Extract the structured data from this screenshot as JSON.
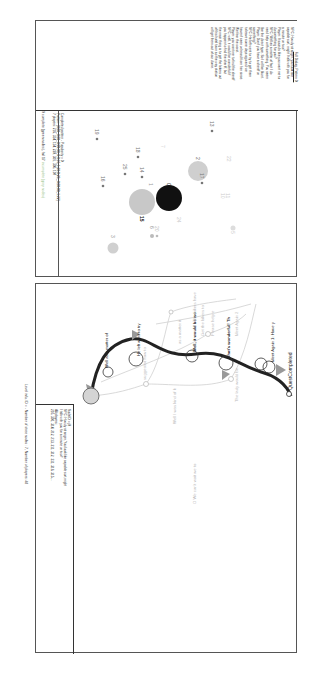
{
  "top_panel": {
    "header": "Level info - Total number of sequences (nodes): 26 with 9 complete (green nodes), fail 17",
    "header_green": "incomplete (grey nodes)",
    "info_box": {
      "line1": "Completed pattern - Popularity = 0",
      "line2": "Pattern: [0,00_0,00_0,99,99_0,9,16_1,20,0,20,_0,00,00_1,22]",
      "line3": "7 players: 216, 314, 114, 220, 301, 306, 107"
    },
    "dialog_box": {
      "title": "Full Dialog, Pattern 0:",
      "lines": [
        "NPC: Howdy stranger, you look like",
        "capable sort, might I talk with you for",
        "a minute or two?",
        "Player: It sounds like you want me to",
        "do something for you?",
        "NPC: Well as a matter of fact I do",
        "need help with something. You seem",
        "like the direct type. So I will be blunt.",
        "Player: Don't you have a sheriff or",
        "something?",
        "NPC: He left went to try to get them",
        "to leave some days ago and we",
        "haven't seen or heard from him since.",
        "We fear the worst.",
        "Player: you want me to find the sheriff",
        "NPC: well, it would be wonderful if",
        "you happen to find the sheriff, but",
        "the main thing is to get the bikers out",
        "of this hotel town so the way station",
        "will get them out of our dome.",
        "Player: Ok, I will get the bikers to",
        "leave town.",
        "NPC: That's wonderful! Thank you",
        "very much. Please come back and tell",
        "me how it went when you are done.",
        "But before you head out, maybe you",
        "should look in the sheriff's office.",
        "You might find something to help me",
        "get rid of the bikers in there. All the",
        "hope and prayers go with you.",
        "Player: Ok, see you around",
        "NPC: Meet Again 1: Have you kicked",
        "the bikers out of the town?",
        "Player: The biker will not trouble you",
        "anymore"
      ]
    },
    "clusters": [
      {
        "id": "0",
        "size": "large",
        "color": "#111111",
        "label": "0"
      },
      {
        "id": "15",
        "size": "large",
        "color": "#c8c8c8",
        "label": "15"
      },
      {
        "id": "2",
        "size": "medium",
        "color": "#cfcfcf",
        "label": "2"
      },
      {
        "id": "3",
        "size": "small",
        "color": "#d0d0d0",
        "label": "3"
      },
      {
        "id": "17",
        "label": "17"
      },
      {
        "id": "19",
        "label": "19"
      },
      {
        "id": "16",
        "label": "16"
      },
      {
        "id": "25",
        "label": "25"
      },
      {
        "id": "14",
        "label": "14"
      },
      {
        "id": "18",
        "label": "18"
      },
      {
        "id": "7",
        "label": "7"
      },
      {
        "id": "13",
        "label": "13"
      },
      {
        "id": "22",
        "label": "22"
      },
      {
        "id": "6",
        "label": "6"
      },
      {
        "id": "20",
        "label": "20"
      },
      {
        "id": "24",
        "label": "24"
      },
      {
        "id": "10",
        "label": "10"
      },
      {
        "id": "11",
        "label": "11"
      },
      {
        "id": "1",
        "label": "1"
      },
      {
        "id": "5",
        "label": "5"
      }
    ]
  },
  "bottom_panel": {
    "header": "Level info, ID = - Number of stree nodes : 7, Number of players: 48",
    "node_box": {
      "line1": "NodeID = j0",
      "line2": "NPC: Howdy stranger, You look like capable sort,might",
      "line3": "I talk with you for a minute or two?",
      "line4": "48 players:",
      "line5": "216, 301, 314, 212, 213, 211, 312, 311, 316, 315,..."
    },
    "nodes": {
      "n1": "Well as a matter of",
      "n2": "He left went to try",
      "n3": "Well, it would be wo",
      "n4": "That's wonderful! Th",
      "n5": "Meet Again 1: Have y",
      "n6": "QuestCompleted",
      "g1": "suggested how to",
      "g2": "Well I was kind of k",
      "g3": "The bikers have",
      "g4": "as a matter it",
      "g5": "Get the bikers to",
      "g6": "Please help e",
      "g7": "Meet Again 2",
      "g8": "The lady would be",
      "g9": "O We can't wait we to"
    }
  }
}
